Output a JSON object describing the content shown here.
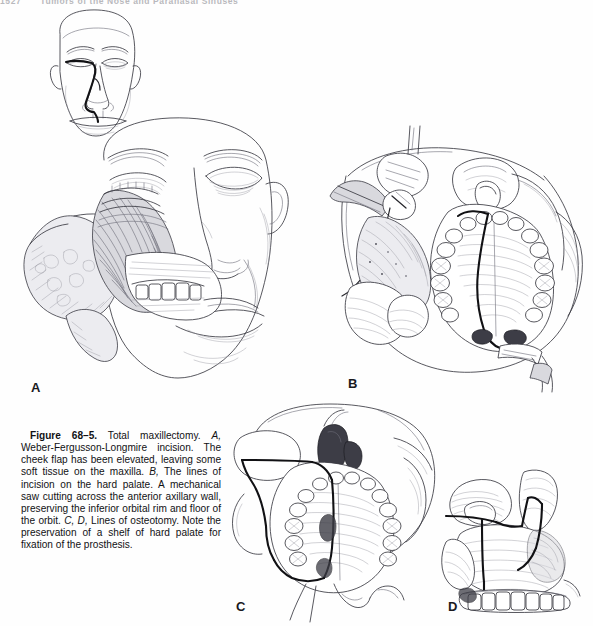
{
  "page": {
    "width": 593,
    "height": 626,
    "background_color": "#fefefe",
    "running_head_page_number": "1527",
    "running_head_title": "Tumors of the Nose and Paranasal Sinuses"
  },
  "figure": {
    "number_label": "Figure 68–5.",
    "caption_segments": [
      {
        "text": "Figure 68–5.",
        "style": "bold"
      },
      {
        "text": " Total maxillectomy. ",
        "style": "roman"
      },
      {
        "text": "A,",
        "style": "italic"
      },
      {
        "text": " Weber-Fergusson-Longmire incision. The cheek flap has been elevated, leaving some soft tissue on the maxilla. ",
        "style": "roman"
      },
      {
        "text": "B,",
        "style": "italic"
      },
      {
        "text": " The lines of incision on the hard palate. A mechanical saw cutting across the anterior axillary wall, preserving the inferior orbital rim and floor of the orbit. ",
        "style": "roman"
      },
      {
        "text": "C, D,",
        "style": "italic"
      },
      {
        "text": " Lines of osteotomy. Note the preservation of a shelf of hard palate for fixation of the prosthesis.",
        "style": "roman"
      }
    ],
    "caption_plain": "Figure 68–5. Total maxillectomy. A, Weber-Fergusson-Longmire incision. The cheek flap has been elevated, leaving some soft tissue on the maxilla. B, The lines of incision on the hard palate. A mechanical saw cutting across the anterior axillary wall, preserving the inferior orbital rim and floor of the orbit. C, D, Lines of osteotomy. Note the preservation of a shelf of hard palate for fixation of the prosthesis."
  },
  "panels": [
    {
      "letter": "A",
      "name": "weber-fergusson-longmire-incision",
      "description": "Frontal view of a face; upper inset shows the Weber-Fergusson-Longmire incision line marked around the nose and through the upper lip. Lower large drawing shows the cheek flap elevated and reflected laterally, exposing the maxilla and upper dentition."
    },
    {
      "letter": "B",
      "name": "hard-palate-incision-lines",
      "description": "Intraoral view of the hard palate with the full maxillary dental arch. Dark incision line runs along the midline of the palate. A mechanical saw on a handpiece cuts across the anterior axillary wall at upper left; a retractor holds the cheek flap."
    },
    {
      "letter": "C",
      "name": "osteotomy-lines-inferior-view",
      "description": "Inferior/basal view of the skull and maxilla. Heavy black lines trace the osteotomy course around the maxilla and across the hard palate, preserving a shelf of hard palate."
    },
    {
      "letter": "D",
      "name": "osteotomy-lines-lateral-view",
      "description": "Lateral view of the maxilla and zygomatic region with heavy black osteotomy lines across the zygoma, orbital rim, and pterygomaxillary junction; lower dentition visible along the alveolus."
    }
  ],
  "colors": {
    "ink": "#3a3a42",
    "ink_heavy": "#111114",
    "ink_light": "#9a9aa4",
    "paper": "#fefefe",
    "caption_text": "#111114",
    "running_head": "#b9b9bd"
  }
}
